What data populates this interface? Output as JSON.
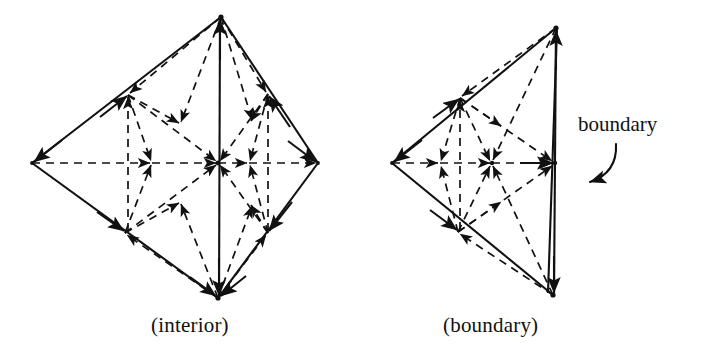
{
  "figure": {
    "title": "",
    "background_color": "#ffffff",
    "ink_color": "#111111",
    "captions": {
      "left": "(interior)",
      "right": "(boundary)"
    },
    "annotations": [
      {
        "label": "boundary",
        "target": "right-figure-vertical-edge",
        "arrow": "curved-arrow-pointing-left-down"
      }
    ],
    "panels": [
      {
        "id": "interior",
        "caption": "(interior)",
        "description": "Barycentrically subdivided tetrahedron drawn as a diamond/quadrilateral outline with solid outer edges, a solid vertical center edge, and dashed interior edges with arrowheads indicating orientation.",
        "solid_edge_style": "solid",
        "interior_edge_style": "dashed",
        "vertices": {
          "top": [
            221,
            17
          ],
          "bottom": [
            218,
            298
          ],
          "left": [
            32,
            163
          ],
          "right": [
            318,
            163
          ],
          "mid_upper_left": [
            128,
            95
          ],
          "mid_upper_right": [
            268,
            94
          ],
          "mid_lower_left": [
            125,
            233
          ],
          "mid_lower_right": [
            268,
            233
          ],
          "center": [
            218,
            163
          ],
          "bary_left": [
            152,
            163
          ],
          "bary_right": [
            249,
            163
          ],
          "bary_upper": [
            180,
            124
          ],
          "bary_lower": [
            180,
            202
          ]
        }
      },
      {
        "id": "boundary",
        "caption": "(boundary)",
        "description": "Barycentrically subdivided triangle (a boundary face of the tetrahedron) with solid outer edges, a solid vertical right edge labeled boundary, and dashed interior edges with arrowheads.",
        "solid_edge_style": "solid",
        "interior_edge_style": "dashed",
        "vertices": {
          "top": [
            556,
            28
          ],
          "bottom": [
            553,
            295
          ],
          "left": [
            392,
            163
          ],
          "right_mid": [
            555,
            163
          ],
          "mid_upper_left": [
            460,
            98
          ],
          "mid_lower_left": [
            458,
            232
          ],
          "center": [
            492,
            163
          ],
          "bary_left": [
            440,
            163
          ],
          "bary_upper": [
            500,
            128
          ],
          "bary_lower": [
            500,
            200
          ]
        }
      }
    ]
  }
}
